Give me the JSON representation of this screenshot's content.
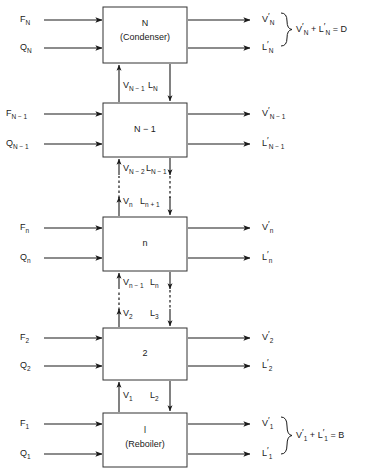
{
  "diagram": {
    "type": "process-block-diagram",
    "stages": [
      {
        "id": "stage-N",
        "number_label": "N",
        "sub_label": "(Condenser)",
        "feed_label": "F",
        "feed_sub": "N",
        "heat_label": "Q",
        "heat_sub": "N",
        "vapor_out_label": "V",
        "vapor_out_sub": "N",
        "liquid_out_label": "L",
        "liquid_out_sub": "N",
        "equation": "V'N + L'N = D"
      },
      {
        "id": "stage-N-1",
        "number_label": "N − 1",
        "sub_label": "",
        "feed_label": "F",
        "feed_sub": "N − 1",
        "heat_label": "Q",
        "heat_sub": "N − 1",
        "vapor_out_label": "V",
        "vapor_out_sub": "N − 1",
        "liquid_out_label": "L",
        "liquid_out_sub": "N − 1",
        "equation": ""
      },
      {
        "id": "stage-n",
        "number_label": "n",
        "sub_label": "",
        "feed_label": "F",
        "feed_sub": "n",
        "heat_label": "Q",
        "heat_sub": "n",
        "vapor_out_label": "V",
        "vapor_out_sub": "n",
        "liquid_out_label": "L",
        "liquid_out_sub": "n",
        "equation": ""
      },
      {
        "id": "stage-2",
        "number_label": "2",
        "sub_label": "",
        "feed_label": "F",
        "feed_sub": "2",
        "heat_label": "Q",
        "heat_sub": "2",
        "vapor_out_label": "V",
        "vapor_out_sub": "2",
        "liquid_out_label": "L",
        "liquid_out_sub": "2",
        "equation": ""
      },
      {
        "id": "stage-1",
        "number_label": "l",
        "sub_label": "(Reboiler)",
        "feed_label": "F",
        "feed_sub": "1",
        "heat_label": "Q",
        "heat_sub": "1",
        "vapor_out_label": "V",
        "vapor_out_sub": "1",
        "liquid_out_label": "L",
        "liquid_out_sub": "1",
        "equation": "V'1 + L'1 = B"
      }
    ],
    "interstage": [
      {
        "id": "gap-N-to-N1",
        "style": "solid",
        "vapor_label": "V",
        "vapor_sub": "N − 1",
        "liquid_label": "L",
        "liquid_sub": "N"
      },
      {
        "id": "gap-N1-to-n",
        "style": "dashed",
        "upper_vapor_label": "V",
        "upper_vapor_sub": "N − 2",
        "upper_liquid_label": "L",
        "upper_liquid_sub": "N − 1",
        "lower_vapor_label": "V",
        "lower_vapor_sub": "n",
        "lower_liquid_label": "L",
        "lower_liquid_sub": "n + 1"
      },
      {
        "id": "gap-n-to-2",
        "style": "dashed",
        "upper_vapor_label": "V",
        "upper_vapor_sub": "n − 1",
        "upper_liquid_label": "L",
        "upper_liquid_sub": "n",
        "lower_vapor_label": "V",
        "lower_vapor_sub": "2",
        "lower_liquid_label": "L",
        "lower_liquid_sub": "3"
      },
      {
        "id": "gap-2-to-1",
        "style": "solid",
        "vapor_label": "V",
        "vapor_sub": "1",
        "liquid_label": "L",
        "liquid_sub": "2"
      }
    ],
    "equations": {
      "top": {
        "lhs_v": "V",
        "lhs_v_sub": "N",
        "lhs_l": "L",
        "lhs_l_sub": "N",
        "rhs": "D",
        "plus": "+",
        "equals": "="
      },
      "bottom": {
        "lhs_v": "V",
        "lhs_v_sub": "1",
        "lhs_l": "L",
        "lhs_l_sub": "1",
        "rhs": "B",
        "plus": "+",
        "equals": "="
      }
    },
    "colors": {
      "line": "#1a1a1a",
      "box_stroke": "#333333",
      "text": "#1a1a1a",
      "background": "#ffffff"
    }
  }
}
